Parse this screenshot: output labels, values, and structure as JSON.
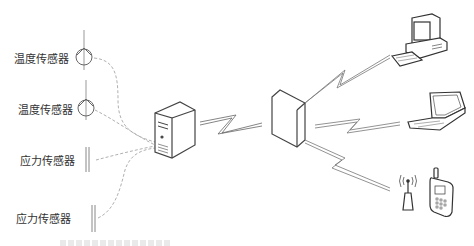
{
  "sensors": [
    {
      "label": "温度传感器",
      "type": "temperature",
      "icon": "temperature-sensor-icon"
    },
    {
      "label": "温度传感器",
      "type": "temperature",
      "icon": "temperature-sensor-icon"
    },
    {
      "label": "应力传感器",
      "type": "stress",
      "icon": "stress-sensor-icon"
    },
    {
      "label": "应力传感器",
      "type": "stress",
      "icon": "stress-sensor-icon"
    }
  ],
  "nodes": {
    "collector": {
      "icon": "server-tower-icon"
    },
    "gateway": {
      "icon": "network-gateway-icon"
    },
    "clients": [
      {
        "icon": "desktop-computer-icon"
      },
      {
        "icon": "laptop-icon"
      },
      {
        "icon": "antenna-icon"
      },
      {
        "icon": "mobile-phone-icon"
      }
    ]
  },
  "links": {
    "sensor_to_collector": "dashed",
    "collector_to_gateway": "wireless-zigzag",
    "gateway_to_clients": "wireless-zigzag"
  },
  "colors": {
    "line": "#555555",
    "dashed": "#b0b0b0",
    "text": "#333333"
  }
}
